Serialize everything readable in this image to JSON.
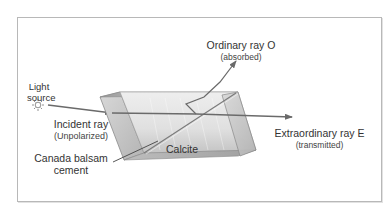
{
  "diagram": {
    "colors": {
      "frame": "#b8b8b8",
      "ray": "#6a6a6a",
      "prism_face": "#d6d6d6",
      "prism_edge": "#8a8a8a",
      "text": "#333333"
    },
    "labels": {
      "light_source": [
        "Light",
        "source"
      ],
      "incident_ray": "Incident ray",
      "incident_ray_sub": "(Unpolarized)",
      "ordinary_ray": "Ordinary ray O",
      "ordinary_ray_sub": "(absorbed)",
      "extraordinary_ray": "Extraordinary ray E",
      "extraordinary_ray_sub": "(transmitted)",
      "calcite": "Calcite",
      "canada_balsam": [
        "Canada balsam",
        "cement"
      ]
    },
    "icons": {
      "light_source": "sun-icon"
    }
  }
}
